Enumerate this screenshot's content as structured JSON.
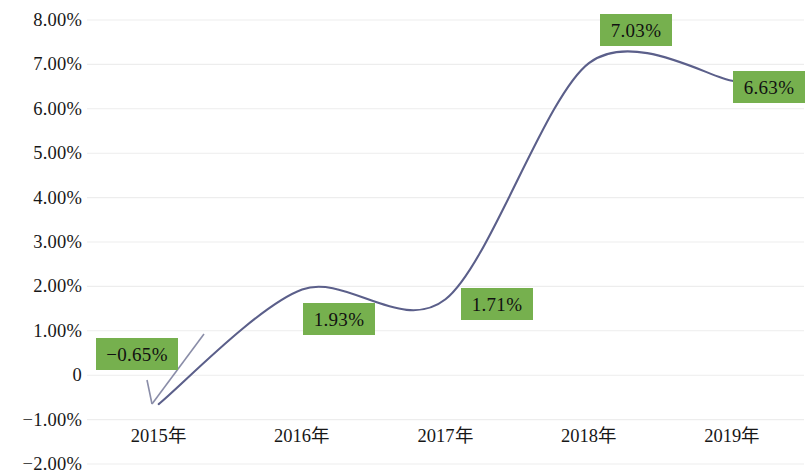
{
  "chart_data": {
    "type": "line",
    "title": "",
    "subtitle": "",
    "xlabel": "",
    "ylabel": "",
    "categories": [
      "2015年",
      "2016年",
      "2017年",
      "2018年",
      "2019年"
    ],
    "values": [
      -0.65,
      1.93,
      1.71,
      7.03,
      6.63
    ],
    "data_labels": [
      "−0.65%",
      "1.93%",
      "1.71%",
      "7.03%",
      "6.63%"
    ],
    "series": [
      {
        "name": "",
        "values": [
          -0.65,
          1.93,
          1.71,
          7.03,
          6.63
        ]
      }
    ],
    "ylim": [
      -2.0,
      8.0
    ],
    "ytick_values": [
      8.0,
      7.0,
      6.0,
      5.0,
      4.0,
      3.0,
      2.0,
      1.0,
      0,
      -1.0,
      -2.0
    ],
    "ytick_labels": [
      "8.00%",
      "7.00%",
      "6.00%",
      "5.00%",
      "4.00%",
      "3.00%",
      "2.00%",
      "1.00%",
      "0",
      "−1.00%",
      "−2.00%"
    ],
    "grid": true,
    "grid_axis": "y",
    "legend": false,
    "legend_position": "none",
    "smooth": true,
    "markers": false,
    "annotations": [
      {
        "text": "−0.65%",
        "leader_line": true,
        "points_to": "2015年"
      }
    ],
    "colors": {
      "line": "#5b5f8a",
      "label_fill": "#76b04e",
      "label_text": "#111111",
      "gridline": "#ededed",
      "axis_text": "#171717",
      "background": "#ffffff"
    }
  }
}
